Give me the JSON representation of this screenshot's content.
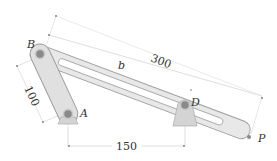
{
  "diagram": {
    "type": "mechanism linkage",
    "points": {
      "A": {
        "label": "A",
        "x": 68,
        "y": 114
      },
      "B": {
        "label": "B",
        "x": 40,
        "y": 54
      },
      "D": {
        "label": "D",
        "x": 185,
        "y": 104
      },
      "P": {
        "label": "P",
        "x": 249,
        "y": 137
      }
    },
    "links": [
      {
        "name": "crank AB",
        "from": "A",
        "to": "B"
      },
      {
        "name": "slotted bar BP",
        "from": "B",
        "to": "P",
        "label": "b"
      }
    ],
    "dimensions": {
      "AB": "100",
      "BP": "300",
      "AD": "150"
    },
    "colors": {
      "link_fill": "#e6e6e6",
      "link_stroke": "#9a9a9a",
      "pin": "#7d7d7d",
      "support_fill": "#d4d4d4",
      "dim_line": "#cfcfcf",
      "text": "#333333"
    }
  }
}
